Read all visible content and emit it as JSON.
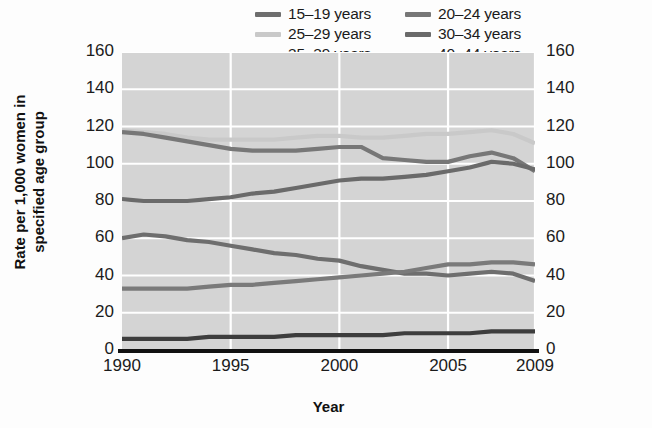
{
  "chart_data": {
    "type": "line",
    "title": "",
    "xlabel": "Year",
    "ylabel": "Rate per 1,000 women in specified age group",
    "ylabel_line1": "Rate per 1,000 women in",
    "ylabel_line2": "specified age group",
    "xlim": [
      1990,
      2009
    ],
    "ylim": [
      0,
      160
    ],
    "yticks": [
      0,
      20,
      40,
      60,
      80,
      100,
      120,
      140,
      160
    ],
    "xticks": [
      1990,
      1995,
      2000,
      2005,
      2009
    ],
    "xtick_labels": [
      "1990",
      "1995",
      "2000",
      "2005",
      "2009"
    ],
    "ytick_labels": [
      "0",
      "20",
      "40",
      "60",
      "80",
      "100",
      "120",
      "140",
      "160"
    ],
    "grid": true,
    "grid_color": "#ffffff",
    "plot_background": "#d4d4d4",
    "legend_position": "top",
    "dual_y_axis": true,
    "x": [
      1990,
      1991,
      1992,
      1993,
      1994,
      1995,
      1996,
      1997,
      1998,
      1999,
      2000,
      2001,
      2002,
      2003,
      2004,
      2005,
      2006,
      2007,
      2008,
      2009
    ],
    "series": [
      {
        "name": "15–19 years",
        "color": "#6e6e6e",
        "values": [
          60,
          62,
          61,
          59,
          58,
          56,
          54,
          52,
          51,
          49,
          48,
          45,
          43,
          41,
          41,
          40,
          41,
          42,
          41,
          37
        ]
      },
      {
        "name": "20–24 years",
        "color": "#777777",
        "values": [
          117,
          116,
          114,
          112,
          110,
          108,
          107,
          107,
          107,
          108,
          109,
          109,
          103,
          102,
          101,
          101,
          104,
          106,
          103,
          96
        ]
      },
      {
        "name": "25–29 years",
        "color": "#c9c9c9",
        "values": [
          118,
          117,
          116,
          114,
          113,
          113,
          113,
          113,
          114,
          115,
          115,
          114,
          114,
          115,
          116,
          116,
          117,
          118,
          116,
          111
        ]
      },
      {
        "name": "30–34 years",
        "color": "#6a6a6a",
        "values": [
          81,
          80,
          80,
          80,
          81,
          82,
          84,
          85,
          87,
          89,
          91,
          92,
          92,
          93,
          94,
          96,
          98,
          101,
          100,
          97
        ]
      },
      {
        "name": "35–39 years",
        "color": "#7a7a7a",
        "values": [
          33,
          33,
          33,
          33,
          34,
          35,
          35,
          36,
          37,
          38,
          39,
          40,
          41,
          42,
          44,
          46,
          46,
          47,
          47,
          46
        ]
      },
      {
        "name": "40–44 years",
        "color": "#3d3d3d",
        "values": [
          6,
          6,
          6,
          6,
          7,
          7,
          7,
          7,
          8,
          8,
          8,
          8,
          8,
          9,
          9,
          9,
          9,
          10,
          10,
          10
        ]
      }
    ]
  },
  "legend": {
    "items": [
      {
        "label": "15–19 years",
        "color": "#6e6e6e"
      },
      {
        "label": "20–24 years",
        "color": "#777777"
      },
      {
        "label": "25–29 years",
        "color": "#c9c9c9"
      },
      {
        "label": "30–34 years",
        "color": "#6a6a6a"
      },
      {
        "label": "35–39 years",
        "color": "#7a7a7a"
      },
      {
        "label": "40–44 years",
        "color": "#3d3d3d"
      }
    ]
  }
}
